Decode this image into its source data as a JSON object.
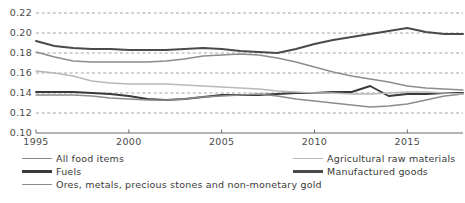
{
  "chart_data": {
    "type": "line",
    "title": "",
    "xlabel": "",
    "ylabel": "",
    "xlim": [
      1995,
      2018
    ],
    "ylim": [
      0.1,
      0.22
    ],
    "ytick_labels": [
      "0.22",
      "0.20",
      "0.18",
      "0.16",
      "0.14",
      "0.12",
      "0.10"
    ],
    "ytick_values": [
      0.22,
      0.2,
      0.18,
      0.16,
      0.14,
      0.12,
      0.1
    ],
    "xtick_labels": [
      "1995",
      "2000",
      "2005",
      "2010",
      "2015"
    ],
    "xtick_values": [
      1995,
      2000,
      2005,
      2010,
      2015
    ],
    "grid": "horizontal-dashed",
    "legend_position": "bottom",
    "x": [
      1995,
      1996,
      1997,
      1998,
      1999,
      2000,
      2001,
      2002,
      2003,
      2004,
      2005,
      2006,
      2007,
      2008,
      2009,
      2010,
      2011,
      2012,
      2013,
      2014,
      2015,
      2016,
      2017,
      2018
    ],
    "series": [
      {
        "name": "All food items",
        "color": "#8c8c8c",
        "width": 1.3,
        "values": [
          0.181,
          0.176,
          0.172,
          0.171,
          0.171,
          0.171,
          0.171,
          0.172,
          0.174,
          0.177,
          0.178,
          0.179,
          0.178,
          0.175,
          0.171,
          0.166,
          0.161,
          0.157,
          0.154,
          0.151,
          0.147,
          0.145,
          0.144,
          0.143
        ]
      },
      {
        "name": "Fuels",
        "color": "#3a3a3a",
        "width": 1.9,
        "values": [
          0.141,
          0.141,
          0.141,
          0.14,
          0.139,
          0.137,
          0.134,
          0.133,
          0.134,
          0.136,
          0.138,
          0.138,
          0.138,
          0.139,
          0.14,
          0.14,
          0.141,
          0.141,
          0.147,
          0.137,
          0.139,
          0.139,
          0.14,
          0.14
        ]
      },
      {
        "name": "Ores, metals, precious stones and non-monetary gold",
        "color": "#8c8c8c",
        "width": 1.3,
        "values": [
          0.138,
          0.138,
          0.138,
          0.137,
          0.135,
          0.134,
          0.133,
          0.133,
          0.134,
          0.136,
          0.137,
          0.138,
          0.139,
          0.137,
          0.134,
          0.132,
          0.13,
          0.128,
          0.126,
          0.127,
          0.129,
          0.133,
          0.137,
          0.139
        ]
      },
      {
        "name": "Agricultural raw materials",
        "color": "#b8b8b8",
        "width": 1.3,
        "values": [
          0.162,
          0.16,
          0.157,
          0.152,
          0.15,
          0.149,
          0.149,
          0.149,
          0.148,
          0.147,
          0.146,
          0.145,
          0.144,
          0.142,
          0.141,
          0.14,
          0.14,
          0.139,
          0.139,
          0.14,
          0.141,
          0.141,
          0.14,
          0.139
        ]
      },
      {
        "name": "Manufactured goods",
        "color": "#4a4a4a",
        "width": 1.9,
        "values": [
          0.192,
          0.187,
          0.185,
          0.184,
          0.184,
          0.183,
          0.183,
          0.183,
          0.184,
          0.185,
          0.184,
          0.182,
          0.181,
          0.18,
          0.184,
          0.189,
          0.193,
          0.196,
          0.199,
          0.202,
          0.205,
          0.201,
          0.199,
          0.199
        ]
      }
    ]
  },
  "legend": {
    "items": [
      {
        "label": "All food items",
        "color": "#8c8c8c",
        "width": 1.3,
        "column": "left",
        "row": 0
      },
      {
        "label": "Fuels",
        "color": "#3a3a3a",
        "width": 2.4,
        "column": "left",
        "row": 1
      },
      {
        "label": "Ores, metals, precious stones and non-monetary gold",
        "color": "#8c8c8c",
        "width": 1.3,
        "column": "left",
        "row": 2
      },
      {
        "label": "Agricultural raw materials",
        "color": "#b8b8b8",
        "width": 1.3,
        "column": "right",
        "row": 0
      },
      {
        "label": "Manufactured goods",
        "color": "#4a4a4a",
        "width": 2.4,
        "column": "right",
        "row": 1
      }
    ]
  },
  "axes": {
    "grid_color": "#9a9a9a",
    "axis_color": "#6a6a6a"
  }
}
